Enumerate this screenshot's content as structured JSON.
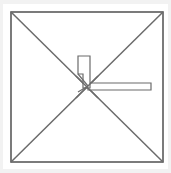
{
  "figure": {
    "title": "Square plan with diagonals and center fixture",
    "kind": "technical-line-drawing",
    "canvas": {
      "width": 171,
      "height": 173,
      "background_color": "#f2f2f2",
      "plate_color": "#ffffff"
    },
    "colors": {
      "outline": "#5a5a5a",
      "diagonal": "#6b6b6b",
      "fixture_stroke": "#6b6b6b",
      "fixture_fill": "#ffffff",
      "plate": "#ffffff",
      "margin": "#f2f2f2"
    },
    "stroke_widths": {
      "outer_square": 1.6,
      "diagonal": 1.5,
      "fixture": 1.2
    },
    "outer_square": {
      "label": "outer-square",
      "x": 11,
      "y": 12,
      "width": 152,
      "height": 150
    },
    "diagonals": [
      {
        "label": "diagonal-tl-br",
        "x1": 11,
        "y1": 12,
        "x2": 163,
        "y2": 162
      },
      {
        "label": "diagonal-tr-bl",
        "x1": 163,
        "y1": 12,
        "x2": 11,
        "y2": 162
      }
    ],
    "center_point": {
      "label": "diagonal-intersection",
      "x": 87,
      "y": 87
    },
    "vertical_fixture": {
      "label": "vertical-stepped-fixture",
      "points": "78,56 90,56 90,88 83,88 83,74 78,74"
    },
    "horizontal_fixture": {
      "label": "horizontal-bar-fixture",
      "points": "88,83 151,83 151,90 88,90"
    },
    "connector_lines": [
      {
        "label": "connector-upper",
        "x1": 78,
        "y1": 74,
        "x2": 88,
        "y2": 86
      },
      {
        "label": "connector-lower",
        "x1": 78,
        "y1": 92,
        "x2": 88,
        "y2": 86
      }
    ]
  }
}
